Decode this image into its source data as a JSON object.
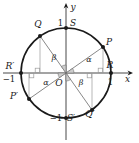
{
  "figure": {
    "y_axis_label": "y",
    "x_axis_label": "x",
    "origin_label": "O",
    "tick_top": "1",
    "tick_right": "1",
    "tick_left": "−1",
    "tick_bottom": "−1",
    "point_P": "P",
    "point_Q": "Q",
    "point_R": "R",
    "point_S": "S",
    "point_P_prime": "P′",
    "point_Q_prime": "Q′",
    "point_R_prime": "R′",
    "point_S_prime": "S′",
    "angle_alpha_upper_right": "α",
    "angle_alpha_lower_left": "α",
    "angle_beta_upper_left": "β",
    "angle_beta_lower_right": "β",
    "colors": {
      "ink": "#1a1a1a",
      "aux": "#9a9a9a",
      "wedge_fill": "#cccccc",
      "wedge_stroke": "#6e6e6e",
      "background": "#ffffff"
    }
  }
}
